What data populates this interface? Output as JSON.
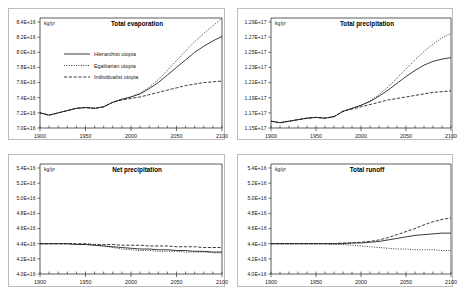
{
  "figure": {
    "unit_label": "kg/yr",
    "series_styles": [
      "solid",
      "dotted",
      "dashed"
    ]
  },
  "legend": {
    "visible_on_panel": "total-evaporation",
    "entries": [
      {
        "label": "Hierarchist utopia",
        "style": "solid"
      },
      {
        "label": "Egalitarian utopia",
        "style": "dotted"
      },
      {
        "label": "Individualist utopia",
        "style": "dashed"
      }
    ]
  },
  "chart_data": [
    {
      "type": "line",
      "title": "Total evaporation",
      "xlabel": "",
      "ylabel": "kg/yr",
      "xlim": [
        1900,
        2100
      ],
      "ylim": [
        7e+16,
        8.4e+16
      ],
      "xticks": [
        1900,
        1950,
        2000,
        2050,
        2100
      ],
      "xtick_labels": [
        "1900",
        "1950",
        "2000",
        "2050",
        "2100"
      ],
      "yticks": [
        7e+16,
        7.2e+16,
        7.4e+16,
        7.6e+16,
        7.8e+16,
        8e+16,
        8.2e+16,
        8.4e+16
      ],
      "ytick_labels": [
        "7.0E+16",
        "7.2E+16",
        "7.4E+16",
        "7.6E+16",
        "7.8E+16",
        "8.0E+16",
        "8.2E+16",
        "8.4E+16"
      ],
      "minor_xtick_interval": 10,
      "grid": false,
      "legend_position": "center-left",
      "x": [
        1900,
        1910,
        1920,
        1930,
        1940,
        1950,
        1960,
        1970,
        1980,
        1990,
        2000,
        2010,
        2020,
        2030,
        2040,
        2050,
        2060,
        2070,
        2080,
        2090,
        2100
      ],
      "series": [
        {
          "name": "Hierarchist utopia",
          "style": "solid",
          "values": [
            7.2e+16,
            7.17e+16,
            7.2e+16,
            7.23e+16,
            7.26e+16,
            7.27e+16,
            7.26e+16,
            7.28e+16,
            7.34e+16,
            7.38e+16,
            7.41e+16,
            7.45e+16,
            7.52e+16,
            7.6e+16,
            7.7e+16,
            7.8e+16,
            7.9e+16,
            8e+16,
            8.08e+16,
            8.15e+16,
            8.21e+16
          ]
        },
        {
          "name": "Egalitarian utopia",
          "style": "dotted",
          "values": [
            7.2e+16,
            7.17e+16,
            7.2e+16,
            7.23e+16,
            7.26e+16,
            7.27e+16,
            7.26e+16,
            7.28e+16,
            7.34e+16,
            7.38e+16,
            7.41e+16,
            7.46e+16,
            7.54e+16,
            7.64e+16,
            7.76e+16,
            7.89e+16,
            8.02e+16,
            8.14e+16,
            8.25e+16,
            8.35e+16,
            8.45e+16
          ]
        },
        {
          "name": "Individualist utopia",
          "style": "dashed",
          "values": [
            7.2e+16,
            7.17e+16,
            7.2e+16,
            7.23e+16,
            7.26e+16,
            7.27e+16,
            7.26e+16,
            7.28e+16,
            7.34e+16,
            7.37e+16,
            7.39e+16,
            7.41e+16,
            7.44e+16,
            7.47e+16,
            7.5e+16,
            7.53e+16,
            7.56e+16,
            7.58e+16,
            7.6e+16,
            7.61e+16,
            7.62e+16
          ]
        }
      ]
    },
    {
      "type": "line",
      "title": "Total precipitation",
      "xlabel": "",
      "ylabel": "kg/yr",
      "xlim": [
        1900,
        2100
      ],
      "ylim": [
        1.15e+17,
        1.29e+17
      ],
      "xticks": [
        1900,
        1950,
        2000,
        2050,
        2100
      ],
      "xtick_labels": [
        "1900",
        "1950",
        "2000",
        "2050",
        "2100"
      ],
      "yticks": [
        1.15e+17,
        1.17e+17,
        1.19e+17,
        1.21e+17,
        1.23e+17,
        1.25e+17,
        1.27e+17,
        1.29e+17
      ],
      "ytick_labels": [
        "1.15E+17",
        "1.17E+17",
        "1.19E+17",
        "1.21E+17",
        "1.23E+17",
        "1.25E+17",
        "1.27E+17",
        "1.29E+17"
      ],
      "minor_xtick_interval": 10,
      "grid": false,
      "legend_position": "none",
      "x": [
        1900,
        1910,
        1920,
        1930,
        1940,
        1950,
        1960,
        1970,
        1980,
        1990,
        2000,
        2010,
        2020,
        2030,
        2040,
        2050,
        2060,
        2070,
        2080,
        2090,
        2100
      ],
      "series": [
        {
          "name": "Hierarchist utopia",
          "style": "solid",
          "values": [
            1.159e+17,
            1.157e+17,
            1.159e+17,
            1.161e+17,
            1.163e+17,
            1.164e+17,
            1.163e+17,
            1.165e+17,
            1.172e+17,
            1.176e+17,
            1.18e+17,
            1.185e+17,
            1.192e+17,
            1.2e+17,
            1.209e+17,
            1.218e+17,
            1.226e+17,
            1.233e+17,
            1.238e+17,
            1.241e+17,
            1.243e+17
          ]
        },
        {
          "name": "Egalitarian utopia",
          "style": "dotted",
          "values": [
            1.159e+17,
            1.157e+17,
            1.159e+17,
            1.161e+17,
            1.163e+17,
            1.164e+17,
            1.163e+17,
            1.165e+17,
            1.172e+17,
            1.176e+17,
            1.18e+17,
            1.186e+17,
            1.194e+17,
            1.204e+17,
            1.216e+17,
            1.228e+17,
            1.24e+17,
            1.251e+17,
            1.261e+17,
            1.269e+17,
            1.275e+17
          ]
        },
        {
          "name": "Individualist utopia",
          "style": "dashed",
          "values": [
            1.159e+17,
            1.157e+17,
            1.159e+17,
            1.161e+17,
            1.163e+17,
            1.164e+17,
            1.163e+17,
            1.165e+17,
            1.172e+17,
            1.175e+17,
            1.178e+17,
            1.181e+17,
            1.184e+17,
            1.187e+17,
            1.189e+17,
            1.191e+17,
            1.193e+17,
            1.195e+17,
            1.197e+17,
            1.198e+17,
            1.199e+17
          ]
        }
      ]
    },
    {
      "type": "line",
      "title": "Net precipitation",
      "xlabel": "",
      "ylabel": "kg/yr",
      "xlim": [
        1900,
        2100
      ],
      "ylim": [
        4e+16,
        5.4e+16
      ],
      "xticks": [
        1900,
        1950,
        2000,
        2050,
        2100
      ],
      "xtick_labels": [
        "1900",
        "1950",
        "2000",
        "2050",
        "2100"
      ],
      "yticks": [
        4e+16,
        4.2e+16,
        4.4e+16,
        4.6e+16,
        4.8e+16,
        5e+16,
        5.2e+16,
        5.4e+16
      ],
      "ytick_labels": [
        "4.0E+16",
        "4.2E+16",
        "4.4E+16",
        "4.6E+16",
        "4.8E+16",
        "5.0E+16",
        "5.2E+16",
        "5.4E+16"
      ],
      "minor_xtick_interval": 10,
      "grid": false,
      "legend_position": "none",
      "x": [
        1900,
        1910,
        1920,
        1930,
        1940,
        1950,
        1960,
        1970,
        1980,
        1990,
        2000,
        2010,
        2020,
        2030,
        2040,
        2050,
        2060,
        2070,
        2080,
        2090,
        2100
      ],
      "series": [
        {
          "name": "Hierarchist utopia",
          "style": "solid",
          "values": [
            4.4e+16,
            4.4e+16,
            4.4e+16,
            4.4e+16,
            4.39e+16,
            4.39e+16,
            4.38e+16,
            4.37e+16,
            4.36e+16,
            4.35e+16,
            4.34e+16,
            4.33e+16,
            4.33e+16,
            4.32e+16,
            4.32e+16,
            4.31e+16,
            4.31e+16,
            4.3e+16,
            4.3e+16,
            4.29e+16,
            4.29e+16
          ]
        },
        {
          "name": "Egalitarian utopia",
          "style": "dotted",
          "values": [
            4.4e+16,
            4.4e+16,
            4.4e+16,
            4.4e+16,
            4.39e+16,
            4.39e+16,
            4.38e+16,
            4.37e+16,
            4.35e+16,
            4.33e+16,
            4.32e+16,
            4.31e+16,
            4.31e+16,
            4.3e+16,
            4.3e+16,
            4.3e+16,
            4.29e+16,
            4.29e+16,
            4.29e+16,
            4.28e+16,
            4.28e+16
          ]
        },
        {
          "name": "Individualist utopia",
          "style": "dashed",
          "values": [
            4.4e+16,
            4.4e+16,
            4.4e+16,
            4.4e+16,
            4.4e+16,
            4.4e+16,
            4.39e+16,
            4.39e+16,
            4.39e+16,
            4.38e+16,
            4.38e+16,
            4.38e+16,
            4.37e+16,
            4.37e+16,
            4.37e+16,
            4.36e+16,
            4.36e+16,
            4.36e+16,
            4.35e+16,
            4.35e+16,
            4.35e+16
          ]
        }
      ]
    },
    {
      "type": "line",
      "title": "Total runoff",
      "xlabel": "",
      "ylabel": "kg/yr",
      "xlim": [
        1900,
        2100
      ],
      "ylim": [
        4e+16,
        5.4e+16
      ],
      "xticks": [
        1900,
        1950,
        2000,
        2050,
        2100
      ],
      "xtick_labels": [
        "1900",
        "1950",
        "2000",
        "2050",
        "2100"
      ],
      "yticks": [
        4e+16,
        4.2e+16,
        4.4e+16,
        4.6e+16,
        4.8e+16,
        5e+16,
        5.2e+16,
        5.4e+16
      ],
      "ytick_labels": [
        "4.0E+16",
        "4.2E+16",
        "4.4E+16",
        "4.6E+16",
        "4.8E+16",
        "5.0E+16",
        "5.2E+16",
        "5.4E+16"
      ],
      "minor_xtick_interval": 10,
      "grid": false,
      "legend_position": "none",
      "x": [
        1900,
        1910,
        1920,
        1930,
        1940,
        1950,
        1960,
        1970,
        1980,
        1990,
        2000,
        2010,
        2020,
        2030,
        2040,
        2050,
        2060,
        2070,
        2080,
        2090,
        2100
      ],
      "series": [
        {
          "name": "Hierarchist utopia",
          "style": "solid",
          "values": [
            4.4e+16,
            4.4e+16,
            4.4e+16,
            4.4e+16,
            4.4e+16,
            4.4e+16,
            4.4e+16,
            4.4e+16,
            4.4e+16,
            4.41e+16,
            4.41e+16,
            4.42e+16,
            4.43e+16,
            4.45e+16,
            4.47e+16,
            4.49e+16,
            4.51e+16,
            4.52e+16,
            4.53e+16,
            4.54e+16,
            4.54e+16
          ]
        },
        {
          "name": "Egalitarian utopia",
          "style": "dotted",
          "values": [
            4.4e+16,
            4.4e+16,
            4.4e+16,
            4.4e+16,
            4.4e+16,
            4.4e+16,
            4.4e+16,
            4.39e+16,
            4.39e+16,
            4.38e+16,
            4.37e+16,
            4.36e+16,
            4.35e+16,
            4.34e+16,
            4.33e+16,
            4.33e+16,
            4.32e+16,
            4.32e+16,
            4.32e+16,
            4.31e+16,
            4.31e+16
          ]
        },
        {
          "name": "Individualist utopia",
          "style": "dashed",
          "values": [
            4.4e+16,
            4.4e+16,
            4.4e+16,
            4.4e+16,
            4.4e+16,
            4.4e+16,
            4.4e+16,
            4.4e+16,
            4.41e+16,
            4.41e+16,
            4.42e+16,
            4.43e+16,
            4.45e+16,
            4.48e+16,
            4.52e+16,
            4.56e+16,
            4.6e+16,
            4.65e+16,
            4.69e+16,
            4.72e+16,
            4.74e+16
          ]
        }
      ]
    }
  ]
}
